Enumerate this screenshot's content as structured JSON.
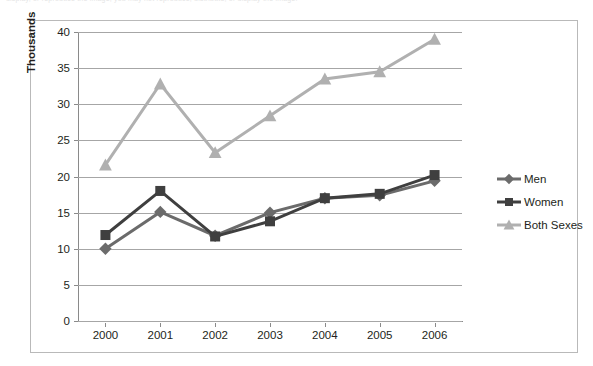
{
  "page": {
    "top_caption": "display, or reproduce the image; you may not reproduce, distribute, or display the image."
  },
  "legend": {
    "position": "right",
    "items": [
      {
        "label": "Men",
        "color": "#6b6b6b",
        "marker": "diamond"
      },
      {
        "label": "Women",
        "color": "#3f3f3f",
        "marker": "square"
      },
      {
        "label": "Both Sexes",
        "color": "#b0b0b0",
        "marker": "triangle"
      }
    ]
  },
  "chart_data": {
    "type": "line",
    "title": "",
    "xlabel": "",
    "ylabel": "Thousands",
    "categories": [
      "2000",
      "2001",
      "2002",
      "2003",
      "2004",
      "2005",
      "2006"
    ],
    "ylim": [
      0,
      40
    ],
    "yticks": [
      0,
      5,
      10,
      15,
      20,
      25,
      30,
      35,
      40
    ],
    "grid": true,
    "series": [
      {
        "name": "Men",
        "color": "#6b6b6b",
        "marker": "diamond",
        "values": [
          10.0,
          15.1,
          11.8,
          15.0,
          17.0,
          17.4,
          19.4
        ]
      },
      {
        "name": "Women",
        "color": "#3f3f3f",
        "marker": "square",
        "values": [
          11.9,
          18.0,
          11.7,
          13.8,
          17.0,
          17.6,
          20.2
        ]
      },
      {
        "name": "Both Sexes",
        "color": "#b0b0b0",
        "marker": "triangle",
        "values": [
          21.6,
          32.8,
          23.3,
          28.4,
          33.5,
          34.5,
          39.0
        ]
      }
    ]
  }
}
